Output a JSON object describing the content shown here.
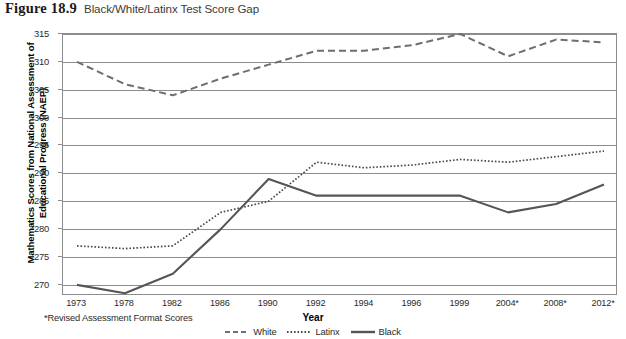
{
  "figure": {
    "number": "Figure 18.9",
    "caption": "Black/White/Latinx Test Score Gap"
  },
  "footnote": "*Revised Assessment Format Scores",
  "chart_data": {
    "type": "line",
    "title": "Black/White/Latinx Test Score Gap",
    "xlabel": "Year",
    "ylabel": "Mathematics Scores from National Assessment of Educational Progress (NAEP)",
    "categories": [
      "1973",
      "1978",
      "1982",
      "1986",
      "1990",
      "1992",
      "1994",
      "1996",
      "1999",
      "2004*",
      "2008*",
      "2012*"
    ],
    "ylim": [
      268,
      315
    ],
    "yticks": [
      270,
      275,
      280,
      285,
      290,
      295,
      300,
      305,
      310,
      315
    ],
    "grid": true,
    "legend_position": "bottom",
    "series": [
      {
        "name": "White",
        "style": "dashed",
        "color": "#6e6e6e",
        "values": [
          310,
          306,
          304,
          307,
          309.5,
          312,
          312,
          313,
          315,
          311,
          314,
          313.5
        ]
      },
      {
        "name": "Latinx",
        "style": "dotted",
        "color": "#4a4a4a",
        "values": [
          277,
          276.5,
          277,
          283,
          285,
          292,
          291,
          291.5,
          292.5,
          292,
          293,
          294
        ]
      },
      {
        "name": "Black",
        "style": "solid",
        "color": "#555555",
        "values": [
          270,
          268.5,
          272,
          280,
          289,
          286,
          286,
          286,
          286,
          283,
          284.5,
          288
        ]
      }
    ]
  }
}
